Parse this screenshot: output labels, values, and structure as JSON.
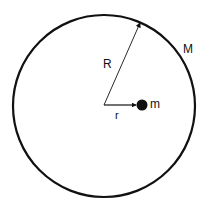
{
  "diagram": {
    "labels": {
      "big_radius": "R",
      "small_radius": "r",
      "shell_mass": "M",
      "point_mass": "m"
    },
    "colors": {
      "stroke": "#111111",
      "background": "#ffffff"
    }
  }
}
